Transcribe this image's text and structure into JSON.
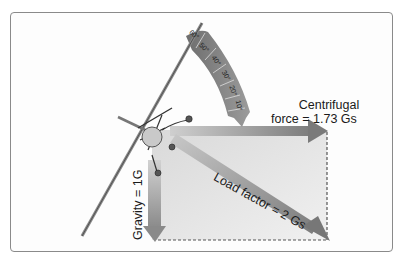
{
  "diagram": {
    "labels": {
      "centrifugal_line1": "Centrifugal",
      "centrifugal_line2": "force = 1.73 Gs",
      "load_factor": "Load factor = 2 Gs",
      "gravity": "Gravity = 1G"
    },
    "bank_scale": {
      "ticks": [
        "60°",
        "50°",
        "40°",
        "30°",
        "20°",
        "10°"
      ]
    },
    "vectors": [
      {
        "name": "centrifugal-force",
        "direction": "horizontal-right",
        "magnitude_g": 1.73
      },
      {
        "name": "gravity",
        "direction": "down",
        "magnitude_g": 1
      },
      {
        "name": "load-factor",
        "direction": "diagonal-down-right",
        "magnitude_g": 2
      }
    ],
    "colors": {
      "arrow": "#8c8c8c",
      "arc_scale": "#7a7a7a",
      "rectangle_fill": "#e4e4e4",
      "frame_border": "#8a8a8a",
      "text": "#1a1a1a"
    }
  }
}
